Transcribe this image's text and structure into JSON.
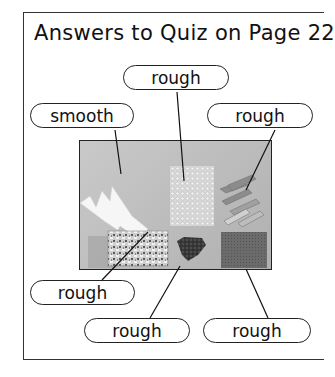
{
  "title": "Answers to Quiz on Page 22",
  "labels": [
    {
      "id": "top-center",
      "text": "rough",
      "material": "bubble-textured sheet"
    },
    {
      "id": "upper-left",
      "text": "smooth",
      "material": "aluminium foil cutout"
    },
    {
      "id": "upper-right",
      "text": "rough",
      "material": "clothes pegs"
    },
    {
      "id": "lower-left",
      "text": "rough",
      "material": "crumpled foil block"
    },
    {
      "id": "bottom-center",
      "text": "rough",
      "material": "gravel pile"
    },
    {
      "id": "bottom-right",
      "text": "rough",
      "material": "scouring pad"
    }
  ],
  "photo": {
    "description": "Photograph of six materials on a grey background"
  },
  "colors": {
    "border": "#222222",
    "photo_bg": "#bdbdbd",
    "text": "#111111"
  }
}
